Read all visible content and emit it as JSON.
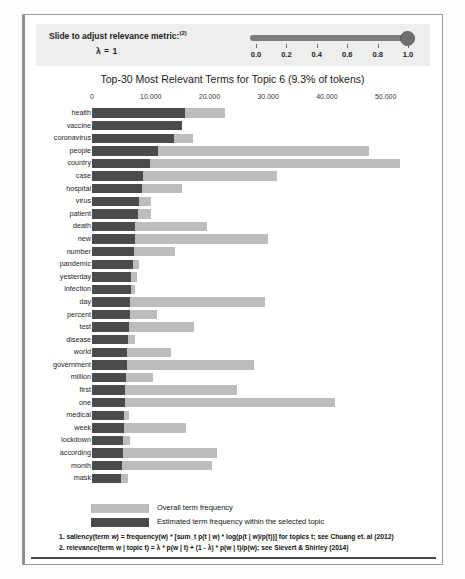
{
  "slider": {
    "label": "Slide to adjust relevance metric:",
    "label_sup": "(2)",
    "lambda_text": "λ = 1",
    "value": 1.0,
    "ticks": [
      "0.0",
      "0.2",
      "0.4",
      "0.6",
      "0.8",
      "1.0"
    ]
  },
  "legend": {
    "overall_label": "Overall term frequency",
    "topic_label": "Estimated term frequency within the selected topic",
    "overall_color": "#bdbdbd",
    "topic_color": "#4b4b4b"
  },
  "footnotes": [
    "1. saliency(term w) = frequency(w) * [sum_t p(t | w) * log(p(t | w)/p(t))] for topics t; see Chuang et. al (2012)",
    "2. relevance(term w | topic t) = λ * p(w | t) + (1 - λ) * p(w | t)/p(w); see Sievert & Shirley (2014)"
  ],
  "chart_data": {
    "type": "bar",
    "orientation": "horizontal",
    "title": "Top-30 Most Relevant Terms for Topic 6 (9.3% of tokens)",
    "topic_number": 6,
    "topic_token_share": "9.3%",
    "xlabel": "",
    "ylabel": "",
    "xlim": [
      0,
      55000
    ],
    "tick_labels": [
      "0",
      "10.000",
      "20.000",
      "30.000",
      "40.000",
      "50.000"
    ],
    "tick_values": [
      0,
      10000,
      20000,
      30000,
      40000,
      50000
    ],
    "grid": false,
    "legend_position": "bottom",
    "categories": [
      "health",
      "vaccine",
      "coronavirus",
      "people",
      "country",
      "case",
      "hospital",
      "virus",
      "patient",
      "death",
      "new",
      "number",
      "pandemic",
      "yesterday",
      "infection",
      "day",
      "percent",
      "test",
      "disease",
      "world",
      "government",
      "million",
      "first",
      "one",
      "medical",
      "week",
      "lockdown",
      "according",
      "month",
      "mask"
    ],
    "series": [
      {
        "name": "Overall term frequency",
        "color": "#bdbdbd",
        "values": [
          22600,
          15300,
          17200,
          47100,
          52500,
          31500,
          15300,
          10100,
          10000,
          19600,
          30000,
          14100,
          8000,
          7600,
          7300,
          29500,
          11100,
          17400,
          7300,
          13500,
          27600,
          10400,
          24700,
          41400,
          6300,
          16000,
          6500,
          21300,
          20400,
          6100
        ]
      },
      {
        "name": "Estimated term frequency within the selected topic",
        "color": "#4b4b4b",
        "values": [
          15800,
          15300,
          14000,
          11200,
          9800,
          8600,
          8500,
          8000,
          7800,
          7400,
          7300,
          7200,
          6900,
          6700,
          6600,
          6500,
          6400,
          6300,
          6200,
          6000,
          5900,
          5800,
          5700,
          5600,
          5500,
          5400,
          5300,
          5200,
          5100,
          5000
        ]
      }
    ]
  }
}
